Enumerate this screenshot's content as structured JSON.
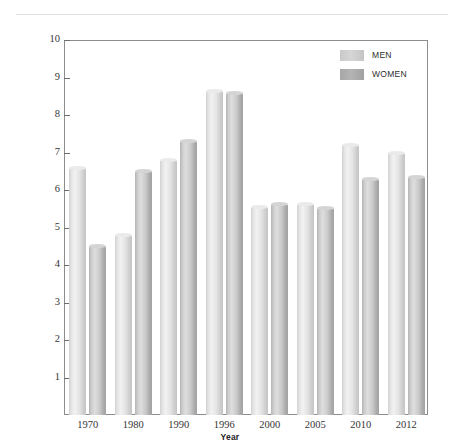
{
  "chart_data": {
    "type": "bar",
    "title": "",
    "xlabel": "Year",
    "ylabel": "Unemployment Rate (Percent)",
    "categories": [
      "1970",
      "1980",
      "1990",
      "1996",
      "2000",
      "2005",
      "2010",
      "2012"
    ],
    "series": [
      {
        "name": "MEN",
        "color": "#d8d8d8",
        "values": [
          6.6,
          4.8,
          6.8,
          8.65,
          5.55,
          5.62,
          7.2,
          7.0
        ]
      },
      {
        "name": "WOMEN",
        "color": "#aaaaaa",
        "values": [
          4.5,
          6.5,
          7.3,
          8.6,
          5.62,
          5.52,
          6.3,
          6.35
        ]
      }
    ],
    "ylim": [
      0,
      10
    ],
    "yticks": [
      "10",
      "9",
      "8",
      "7",
      "6",
      "5",
      "4",
      "3",
      "2",
      "1"
    ],
    "ytick_values": [
      10,
      9,
      8,
      7,
      6,
      5,
      4,
      3,
      2,
      1
    ],
    "grid": false,
    "legend_position": "top-right"
  },
  "legend": {
    "items": [
      {
        "label": "MEN"
      },
      {
        "label": "WOMEN"
      }
    ]
  }
}
